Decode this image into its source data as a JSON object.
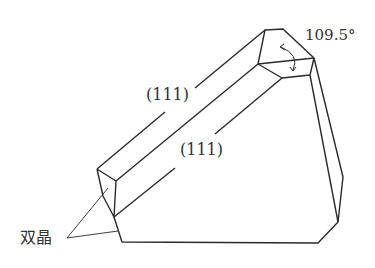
{
  "diagram": {
    "labels": {
      "face_upper": "(111)",
      "face_lower": "(111)",
      "angle": "109.5°",
      "twin": "双晶"
    },
    "colors": {
      "line": "#2a2a2a",
      "text": "#333333",
      "background": "#ffffff"
    }
  }
}
